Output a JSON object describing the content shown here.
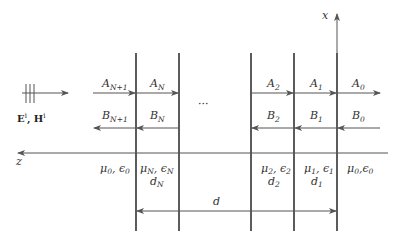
{
  "diagram": {
    "incident_label": {
      "main1": "E",
      "sup1": "i",
      "sep": ", ",
      "main2": "H",
      "sup2": "i"
    },
    "axes": {
      "x_label": "x",
      "z_label": "z"
    },
    "forward_waves": [
      {
        "base": "A",
        "sub": "N+1"
      },
      {
        "base": "A",
        "sub": "N"
      },
      {
        "base": "A",
        "sub": "2"
      },
      {
        "base": "A",
        "sub": "1"
      },
      {
        "base": "A",
        "sub": "0"
      }
    ],
    "backward_waves": [
      {
        "base": "B",
        "sub": "N+1"
      },
      {
        "base": "B",
        "sub": "N"
      },
      {
        "base": "B",
        "sub": "2"
      },
      {
        "base": "B",
        "sub": "1"
      },
      {
        "base": "B",
        "sub": "0"
      }
    ],
    "ellipsis": "···",
    "regions": [
      {
        "mu": "μ",
        "mu_sub": "0",
        "eps": "ϵ",
        "eps_sub": "0",
        "thickness": ""
      },
      {
        "mu": "μ",
        "mu_sub": "N",
        "eps": "ϵ",
        "eps_sub": "N",
        "thickness": "d",
        "thickness_sub": "N"
      },
      {
        "mu": "μ",
        "mu_sub": "2",
        "eps": "ϵ",
        "eps_sub": "2",
        "thickness": "d",
        "thickness_sub": "2"
      },
      {
        "mu": "μ",
        "mu_sub": "1",
        "eps": "ϵ",
        "eps_sub": "1",
        "thickness": "d",
        "thickness_sub": "1"
      },
      {
        "mu": "μ",
        "mu_sub": "0",
        "eps": "ϵ",
        "eps_sub": "0",
        "thickness": ""
      }
    ],
    "total_thickness": "d",
    "colors": {
      "line": "#333333",
      "thin_line": "#555555",
      "text": "#333333"
    }
  }
}
